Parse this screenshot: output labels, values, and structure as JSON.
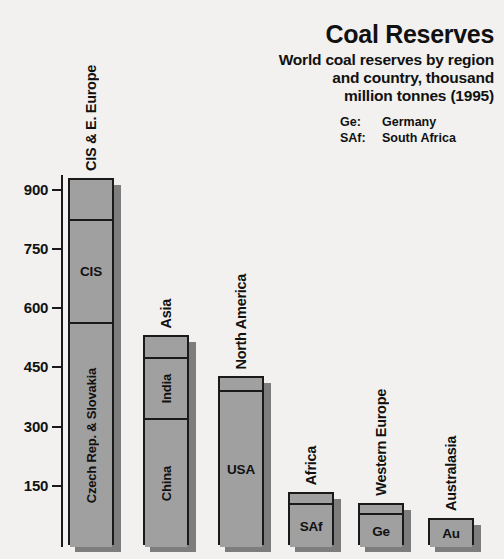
{
  "header": {
    "title": "Coal Reserves",
    "subtitle_lines": [
      "World coal reserves by region",
      "and country, thousand",
      "million tonnes (1995)"
    ],
    "abbreviations": [
      {
        "key": "Ge:",
        "value": "Germany"
      },
      {
        "key": "SAf:",
        "value": "South Africa"
      }
    ]
  },
  "axis": {
    "ticks": [
      "900",
      "750",
      "600",
      "450",
      "300",
      "150"
    ],
    "tick_values": [
      900,
      750,
      600,
      450,
      300,
      150
    ],
    "min": 0,
    "max": 960
  },
  "colors": {
    "background": "#f2f1ef",
    "bar_fill": "#a0a0a0",
    "bar_outline": "#1a1a1a",
    "bar_shadow": "#7d7d7d",
    "text": "#111111"
  },
  "chart_data": {
    "type": "bar",
    "title": "Coal Reserves",
    "subtitle": "World coal reserves by region and country, thousand million tonnes (1995)",
    "xlabel": "",
    "ylabel": "",
    "ylim": [
      0,
      960
    ],
    "yticks": [
      150,
      300,
      450,
      600,
      750,
      900
    ],
    "grid": false,
    "legend": "none",
    "stacked": true,
    "units": "thousand million tonnes",
    "year": 1995,
    "categories": [
      "CIS & E. Europe",
      "Asia",
      "North America",
      "Africa",
      "Western Europe",
      "Australasia"
    ],
    "values": [
      930,
      532,
      428,
      134,
      106,
      68
    ],
    "bars": [
      {
        "group": "CIS & E. Europe",
        "total": 930,
        "segments": [
          {
            "label": "",
            "value": 103
          },
          {
            "label": "CIS",
            "value": 262
          },
          {
            "label": "Czech Rep. & Slovakia",
            "value": 565
          }
        ]
      },
      {
        "group": "Asia",
        "total": 532,
        "segments": [
          {
            "label": "",
            "value": 56
          },
          {
            "label": "India",
            "value": 154
          },
          {
            "label": "China",
            "value": 322
          }
        ]
      },
      {
        "group": "North America",
        "total": 428,
        "segments": [
          {
            "label": "",
            "value": 35
          },
          {
            "label": "USA",
            "value": 393
          }
        ]
      },
      {
        "group": "Africa",
        "total": 134,
        "segments": [
          {
            "label": "",
            "value": 28
          },
          {
            "label": "SAf",
            "value": 106
          }
        ]
      },
      {
        "group": "Western Europe",
        "total": 106,
        "segments": [
          {
            "label": "",
            "value": 25
          },
          {
            "label": "Ge",
            "value": 81
          }
        ]
      },
      {
        "group": "Australasia",
        "total": 68,
        "segments": [
          {
            "label": "Au",
            "value": 68
          }
        ]
      }
    ]
  }
}
